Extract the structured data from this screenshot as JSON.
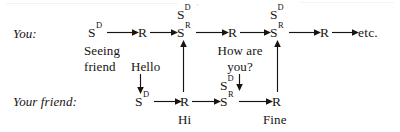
{
  "figure": {
    "type": "flow-diagram",
    "title_visible": false,
    "ink_color": "#171412",
    "background_color": "#ffffff",
    "rows": [
      {
        "id": "you",
        "label": "You:"
      },
      {
        "id": "friend",
        "label": "Your friend:"
      }
    ],
    "node_labels": {
      "sd": "S",
      "sd_sup": "D",
      "sr": "S",
      "sr_sup": "R",
      "r": "R",
      "etc": "etc."
    },
    "top_chain": [
      {
        "name": "sd-1",
        "base": "S",
        "sup": "D"
      },
      {
        "name": "r-1",
        "base": "R",
        "sup": ""
      },
      {
        "name": "sr-1",
        "base": "S",
        "sup": "R"
      },
      {
        "name": "r-2",
        "base": "R",
        "sup": ""
      },
      {
        "name": "sr-2",
        "base": "S",
        "sup": "R"
      },
      {
        "name": "r-3",
        "base": "R",
        "sup": ""
      },
      {
        "name": "etc",
        "base": "etc.",
        "sup": ""
      }
    ],
    "bottom_chain": [
      {
        "name": "sd-b1",
        "base": "S",
        "sup": "D"
      },
      {
        "name": "r-b1",
        "base": "R",
        "sup": ""
      },
      {
        "name": "sr-b1",
        "base": "S",
        "sup": "R"
      },
      {
        "name": "r-b2",
        "base": "R",
        "sup": ""
      }
    ],
    "floating_stimuli": [
      {
        "name": "sd-above-sr1",
        "base": "S",
        "sup": "D"
      },
      {
        "name": "sd-above-sr2",
        "base": "S",
        "sup": "D"
      },
      {
        "name": "sd-above-srb1",
        "base": "S",
        "sup": "D"
      }
    ],
    "captions": {
      "seeing_friend_line1": "Seeing",
      "seeing_friend_line2": "friend",
      "hello": "Hello",
      "hi": "Hi",
      "how_are_line1": "How are",
      "how_are_line2": "you?",
      "fine": "Fine"
    }
  }
}
